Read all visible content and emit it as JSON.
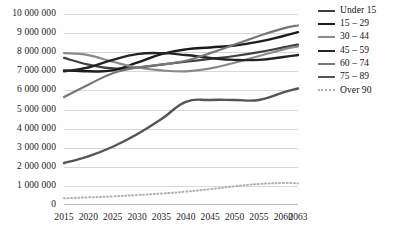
{
  "chart_data": {
    "type": "line",
    "title": "",
    "xlabel": "",
    "ylabel": "",
    "x": [
      2015,
      2020,
      2025,
      2030,
      2035,
      2040,
      2045,
      2050,
      2055,
      2060,
      2063
    ],
    "xlim": [
      2015,
      2063
    ],
    "ylim": [
      0,
      10000000
    ],
    "ytick_values": [
      0,
      1000000,
      2000000,
      3000000,
      4000000,
      5000000,
      6000000,
      7000000,
      8000000,
      9000000,
      10000000
    ],
    "ytick_labels": [
      "0",
      "1 000 000",
      "2 000 000",
      "3 000 000",
      "4 000 000",
      "5 000 000",
      "6 000 000",
      "7 000 000",
      "8 000 000",
      "9 000 000",
      "10 000 000"
    ],
    "xtick_labels": [
      "2015",
      "2020",
      "2025",
      "2030",
      "2035",
      "2040",
      "2045",
      "2050",
      "2055",
      "2060",
      "2063"
    ],
    "grid": true,
    "legend_position": "right",
    "series": [
      {
        "name": "Under 15",
        "color": "#3f3f3f",
        "width": 2.2,
        "dash": "",
        "values": [
          7700000,
          7350000,
          7150000,
          7200000,
          7350000,
          7500000,
          7650000,
          7800000,
          8000000,
          8250000,
          8400000
        ]
      },
      {
        "name": "15 – 29",
        "color": "#1c1c1c",
        "width": 2.4,
        "dash": "",
        "values": [
          7050000,
          7000000,
          7050000,
          7450000,
          7900000,
          8150000,
          8250000,
          8350000,
          8550000,
          8850000,
          9050000
        ]
      },
      {
        "name": "30 – 44",
        "color": "#8a8a8a",
        "width": 2.2,
        "dash": "",
        "values": [
          7950000,
          7850000,
          7500000,
          7200000,
          7050000,
          7000000,
          7150000,
          7450000,
          7800000,
          8150000,
          8300000
        ]
      },
      {
        "name": "45 – 59",
        "color": "#242424",
        "width": 2.4,
        "dash": "",
        "values": [
          7000000,
          7200000,
          7600000,
          7900000,
          7950000,
          7850000,
          7700000,
          7600000,
          7600000,
          7750000,
          7850000
        ]
      },
      {
        "name": "60 – 74",
        "color": "#777777",
        "width": 2.2,
        "dash": "",
        "values": [
          5650000,
          6300000,
          6900000,
          7200000,
          7350000,
          7550000,
          7950000,
          8400000,
          8850000,
          9250000,
          9400000
        ]
      },
      {
        "name": "75 – 89",
        "color": "#555555",
        "width": 2.4,
        "dash": "",
        "values": [
          2200000,
          2550000,
          3050000,
          3700000,
          4500000,
          5400000,
          5500000,
          5500000,
          5500000,
          5900000,
          6100000
        ]
      },
      {
        "name": "Over 90",
        "color": "#b0b0b0",
        "width": 2.0,
        "dash": "1,2.6",
        "values": [
          350000,
          400000,
          450000,
          520000,
          600000,
          700000,
          830000,
          980000,
          1100000,
          1150000,
          1130000
        ]
      }
    ]
  }
}
